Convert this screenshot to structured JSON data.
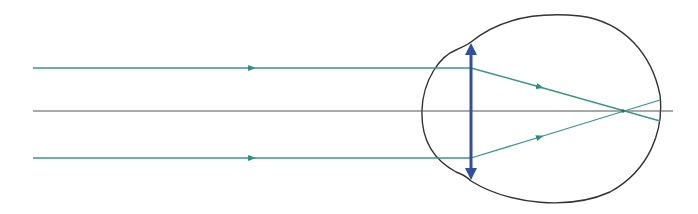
{
  "diagram": {
    "colors": {
      "background": "#ffffff",
      "ray": "#3a9488",
      "axis": "#555555",
      "eye_outline": "#333333",
      "lens": "#2f4fa0"
    },
    "elements": {
      "optical_axis": {
        "label": "optical axis",
        "x1": 33,
        "y1": 111,
        "x2": 673,
        "y2": 111
      },
      "lens": {
        "label": "converging lens",
        "x": 471,
        "y_top": 43,
        "y_bottom": 180
      },
      "focal_point": {
        "label": "focal point",
        "x": 623,
        "y": 111
      },
      "rays": [
        {
          "label": "upper incident ray",
          "start_x": 33,
          "y": 68,
          "arrow_x": 252,
          "refracted_arrow_x": 540,
          "end_x": 660,
          "end_y": 121
        },
        {
          "label": "lower incident ray",
          "start_x": 33,
          "y": 158,
          "arrow_x": 252,
          "refracted_arrow_x": 540,
          "end_x": 660,
          "end_y": 100
        }
      ],
      "eye": {
        "label": "eyeball outline"
      }
    }
  }
}
